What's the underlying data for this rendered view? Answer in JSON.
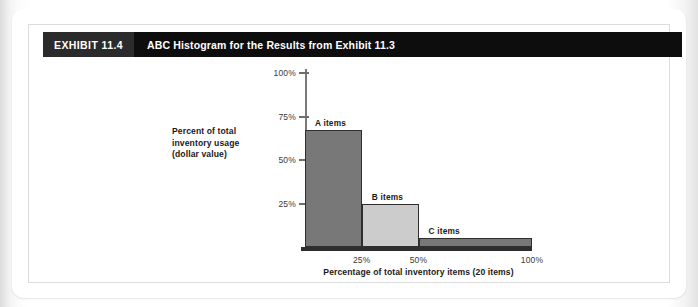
{
  "exhibit": {
    "badge": "EXHIBIT 11.4",
    "title": "ABC Histogram for the Results from Exhibit 11.3"
  },
  "colors": {
    "titlebar_bg": "#0d0d0d",
    "badge_bg": "#2b2b2b",
    "bar_dark": "#787878",
    "bar_light": "#cccccc",
    "bar_outline": "#2e2e2e",
    "axis": "#6e6e6e"
  },
  "chart_data": {
    "type": "bar",
    "title": "ABC Histogram for the Results from Exhibit 11.3",
    "xlabel": "Percentage of total inventory items (20 items)",
    "ylabel": "Percent of total inventory usage (dollar value)",
    "ylabel_lines": [
      "Percent of total",
      "inventory usage",
      "(dollar value)"
    ],
    "categories": [
      "A items",
      "B items",
      "C items"
    ],
    "values": [
      67,
      25,
      5
    ],
    "bar_spans": [
      [
        0,
        25
      ],
      [
        25,
        50
      ],
      [
        50,
        100
      ]
    ],
    "bar_fills": [
      "#787878",
      "#cccccc",
      "#787878"
    ],
    "ylim": [
      0,
      100
    ],
    "xlim": [
      0,
      100
    ],
    "yticks": [
      25,
      50,
      75,
      100
    ],
    "ytick_labels": [
      "25%",
      "50%",
      "75%",
      "100%"
    ],
    "xticks": [
      25,
      50,
      100
    ],
    "xtick_labels": [
      "25%",
      "50%",
      "100%"
    ],
    "grid": false,
    "legend": false
  }
}
